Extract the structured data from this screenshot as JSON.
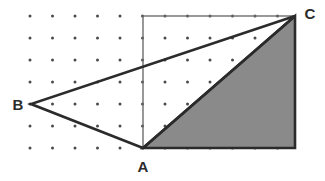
{
  "figure": {
    "background_color": "#ffffff",
    "canvas": {
      "width": 325,
      "height": 181
    }
  },
  "chart_data": {
    "type": "diagram",
    "title": "",
    "grid": {
      "visible": true,
      "dot_color": "#4a4a4a",
      "dot_radius": 1.5,
      "origin_x": 30,
      "origin_y": 16,
      "spacing_x": 22.5,
      "spacing_y": 22,
      "columns": 12,
      "rows": 7
    },
    "rectangle": {
      "name": "bounding-rectangle",
      "x1": 143,
      "y1": 16,
      "x2": 295,
      "y2": 148,
      "stroke": "#6e6e6e",
      "stroke_width": 1.4,
      "fill": "none"
    },
    "points": [
      {
        "id": "A",
        "label": "A",
        "x": 143,
        "y": 148,
        "label_x": 143,
        "label_y": 172,
        "label_anchor": "middle"
      },
      {
        "id": "B",
        "label": "B",
        "x": 31,
        "y": 104,
        "label_x": 18,
        "label_y": 110,
        "label_anchor": "middle"
      },
      {
        "id": "C",
        "label": "C",
        "x": 295,
        "y": 16,
        "label_x": 310,
        "label_y": 19,
        "label_anchor": "middle"
      }
    ],
    "triangle": {
      "name": "triangle-ABC",
      "vertices": "A,B,C",
      "polygon": "143,148 31,104 295,16",
      "stroke": "#2b2b2b",
      "stroke_width": 2.6,
      "fill": "none"
    },
    "shaded_region": {
      "name": "shaded-right-triangle",
      "vertices": "A, C, bottom-right-corner",
      "polygon": "143,148 295,16 295,148",
      "fill": "#8a8a8a",
      "stroke": "#2b2b2b",
      "stroke_width": 2.6,
      "description": "Right triangle between A, C and the bottom-right corner of the rectangle, filled solid gray"
    },
    "labels": [
      "A",
      "B",
      "C"
    ],
    "legend": [],
    "annotations": []
  }
}
